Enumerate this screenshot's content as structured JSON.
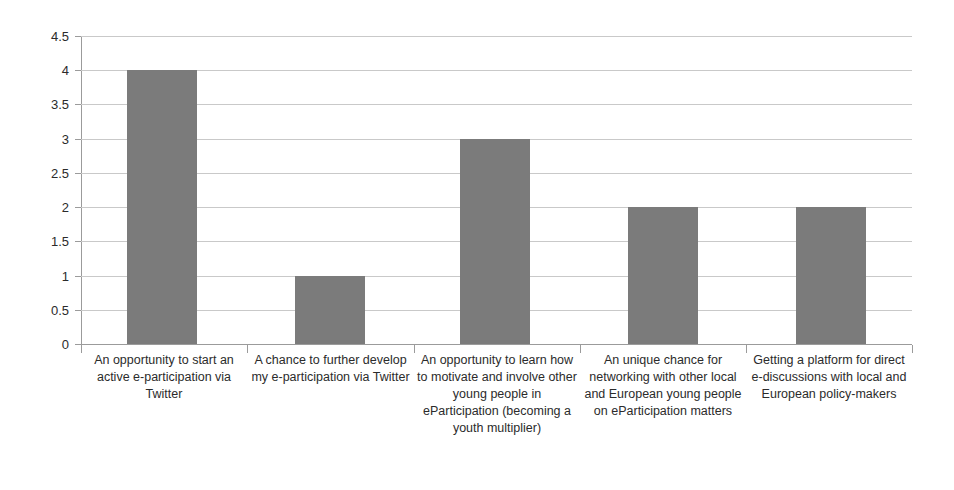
{
  "chart_data": {
    "type": "bar",
    "title": "",
    "subtitle": "",
    "xlabel": "",
    "ylabel": "",
    "ylim": [
      0,
      4.5
    ],
    "ytick_step": 0.5,
    "grid": true,
    "legend": false,
    "legend_position": "none",
    "bar_color": "#7b7b7b",
    "grid_color": "#c9c9c9",
    "axis_color": "#9b9b9b",
    "text_color": "#2b2b2b",
    "ytick_labels": [
      "4.5",
      "4",
      "3.5",
      "3",
      "2.5",
      "2",
      "1.5",
      "1",
      "0.5",
      "0"
    ],
    "ytick_values": [
      4.5,
      4,
      3.5,
      3,
      2.5,
      2,
      1.5,
      1,
      0.5,
      0
    ],
    "categories": [
      "An opportunity to start an active e-participation via Twitter",
      "A chance to further develop my e-participation via Twitter",
      "An opportunity to learn how to motivate and involve other young people in eParticipation (becoming a youth multiplier)",
      "An unique chance for networking with other local and European young people on eParticipation matters",
      "Getting a platform for direct e-discussions with local and European policy-makers"
    ],
    "values": [
      4,
      1,
      3,
      2,
      2
    ]
  }
}
